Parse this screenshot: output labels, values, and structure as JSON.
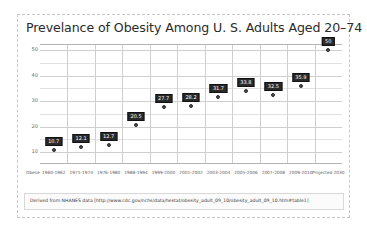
{
  "slide": {
    "title": "Prevelance of Obesity Among U. S. Adults Aged 20–74",
    "footer_note": "Derived from NHANES data [http://www.cdc.gov/nchs/data/hestat/obesity_adult_09_10/obesity_adult_09_10.htm#table1]",
    "axis_corner_label": "Obese"
  },
  "chart_data": {
    "type": "scatter",
    "title": "Prevelance of Obesity Among U. S. Adults Aged 20–74",
    "xlabel": "",
    "ylabel": "",
    "ylim": [
      5,
      52
    ],
    "yticks": [
      10,
      20,
      30,
      40,
      50
    ],
    "grid": true,
    "legend": "none",
    "categories": [
      "1960-1962",
      "1971-1974",
      "1976-1980",
      "1988-1994",
      "1999-2000",
      "2001-2002",
      "2003-2004",
      "2005-2006",
      "2007-2008",
      "2009-2010",
      "Projected 2030"
    ],
    "values": [
      10.7,
      12.1,
      12.7,
      20.5,
      27.7,
      28.2,
      31.7,
      33.8,
      32.5,
      35.9,
      50
    ],
    "point_labels": [
      "10.7",
      "12.1",
      "12.7",
      "20.5",
      "27.7",
      "28.2",
      "31.7",
      "33.8",
      "32.5",
      "35.9",
      "50"
    ]
  },
  "colors": {
    "marker": "#4a4a4a",
    "label_bg": "#2a2a2a",
    "label_text": "#ffffff",
    "grid": "#cfcfcf",
    "axis": "#b4b4b4",
    "frame": "#c9c9c9"
  }
}
